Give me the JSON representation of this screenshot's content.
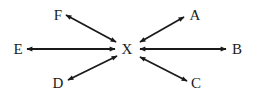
{
  "diagram": {
    "center": {
      "id": "X",
      "label": "X"
    },
    "nodes": [
      {
        "id": "A",
        "label": "A"
      },
      {
        "id": "B",
        "label": "B"
      },
      {
        "id": "C",
        "label": "C"
      },
      {
        "id": "D",
        "label": "D"
      },
      {
        "id": "E",
        "label": "E"
      },
      {
        "id": "F",
        "label": "F"
      }
    ],
    "edges": [
      {
        "from": "X",
        "to": "A",
        "bidirectional": true
      },
      {
        "from": "X",
        "to": "B",
        "bidirectional": true
      },
      {
        "from": "X",
        "to": "C",
        "bidirectional": true
      },
      {
        "from": "X",
        "to": "D",
        "bidirectional": true
      },
      {
        "from": "X",
        "to": "E",
        "bidirectional": true
      },
      {
        "from": "X",
        "to": "F",
        "bidirectional": true
      }
    ],
    "colors": {
      "ink": "#1a1a1a",
      "background": "#ffffff"
    }
  }
}
